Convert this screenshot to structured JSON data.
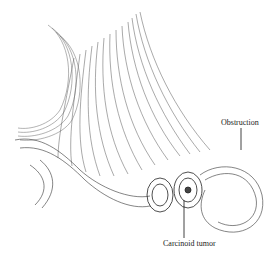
{
  "figure": {
    "labels": [
      {
        "id": "obstruction",
        "text": "Obstruction"
      },
      {
        "id": "carcinoid",
        "text": "Carcinoid tumor"
      }
    ],
    "colors": {
      "ink": "#2a2a2a",
      "background": "#ffffff"
    }
  }
}
